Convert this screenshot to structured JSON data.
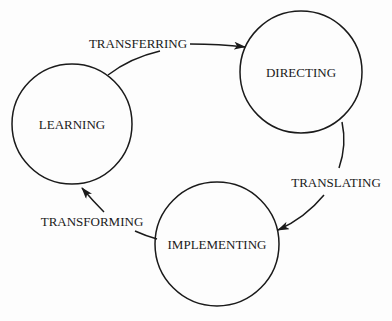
{
  "diagram": {
    "type": "cycle",
    "nodes": [
      {
        "id": "learning",
        "label": "LEARNING",
        "cx": 72,
        "cy": 124,
        "r": 60
      },
      {
        "id": "directing",
        "label": "DIRECTING",
        "cx": 301,
        "cy": 72,
        "r": 61
      },
      {
        "id": "implementing",
        "label": "IMPLEMENTING",
        "cx": 217,
        "cy": 244,
        "r": 62
      }
    ],
    "edges": [
      {
        "from": "learning",
        "to": "directing",
        "label": "TRANSFERRING"
      },
      {
        "from": "directing",
        "to": "implementing",
        "label": "TRANSLATING"
      },
      {
        "from": "implementing",
        "to": "learning",
        "label": "TRANSFORMING"
      }
    ]
  },
  "colors": {
    "stroke": "#1a1a1a",
    "background": "#fdfdfd"
  }
}
